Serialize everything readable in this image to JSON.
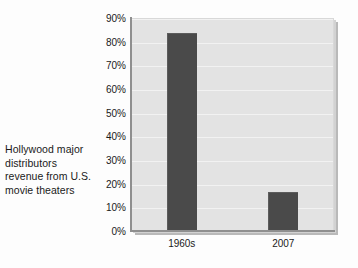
{
  "caption": {
    "lines": [
      "Hollywood major",
      "distributors",
      "revenue from U.S.",
      "movie theaters"
    ]
  },
  "colors": {
    "bar": "#4a4a4a",
    "plot_background": "#e3e3e3",
    "page_background": "#fdfdfd",
    "axis": "#8f8f8f",
    "gridline": "#f2f2f2",
    "text": "#1a1a1a"
  },
  "chart_data": {
    "type": "bar",
    "title": "Hollywood major distributors revenue from U.S. movie theaters",
    "categories": [
      "1960s",
      "2007"
    ],
    "values": [
      84,
      17
    ],
    "value_labels": [
      "84%",
      "17%"
    ],
    "xlabel": "",
    "ylabel": "",
    "ylim": [
      0,
      90
    ],
    "ytick_values": [
      0,
      10,
      20,
      30,
      40,
      50,
      60,
      70,
      80,
      90
    ],
    "ytick_labels": [
      "0%",
      "10%",
      "20%",
      "30%",
      "40%",
      "50%",
      "60%",
      "70%",
      "80%",
      "90%"
    ],
    "grid": true,
    "legend": false,
    "legend_position": "none",
    "series": [
      {
        "name": "Share of revenue",
        "values": [
          84,
          17
        ]
      }
    ]
  }
}
